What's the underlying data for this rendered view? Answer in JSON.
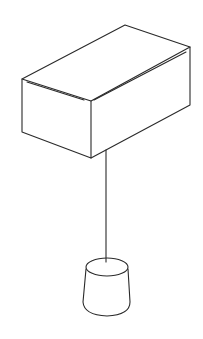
{
  "figure": {
    "stroke_color": "#2a2a2a",
    "background": "#ffffff",
    "objects": [
      "block",
      "string",
      "hanging-weight"
    ]
  }
}
